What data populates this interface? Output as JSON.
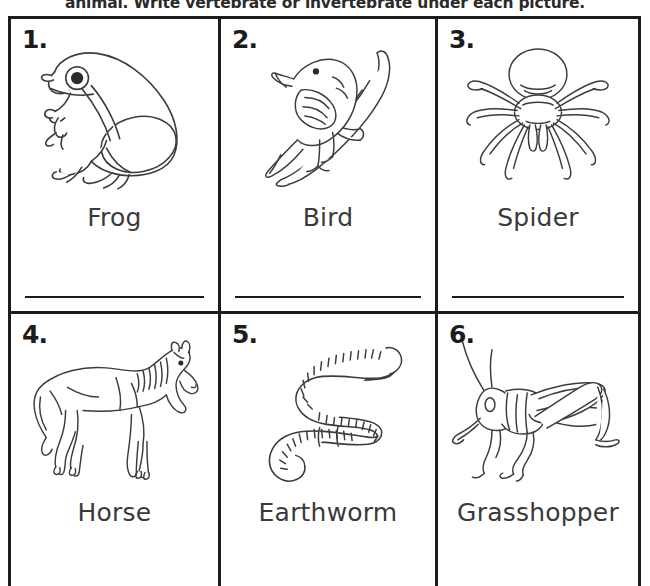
{
  "worksheet": {
    "instructions": "animal. Write vertebrate or invertebrate under each picture.",
    "numbers": [
      "1.",
      "2.",
      "3.",
      "4.",
      "5.",
      "6."
    ],
    "items": [
      {
        "number": "1.",
        "label": "Frog",
        "icon": "frog-illustration"
      },
      {
        "number": "2.",
        "label": "Bird",
        "icon": "bird-on-branch-illustration"
      },
      {
        "number": "3.",
        "label": "Spider",
        "icon": "spider-illustration"
      },
      {
        "number": "4.",
        "label": "Horse",
        "icon": "horse-illustration"
      },
      {
        "number": "5.",
        "label": "Earthworm",
        "icon": "earthworm-illustration"
      },
      {
        "number": "6.",
        "label": "Grasshopper",
        "icon": "grasshopper-illustration"
      }
    ],
    "colors": {
      "ink": "#1c1c1c",
      "label_text": "#3a3a3a",
      "paper": "#ffffff",
      "line_art": "#3c3c3c"
    }
  }
}
